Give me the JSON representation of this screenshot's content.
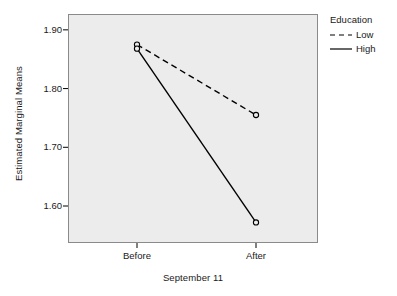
{
  "chart_data": {
    "type": "line",
    "title": "",
    "xlabel": "September 11",
    "ylabel": "Estimated Marginal Means",
    "categories": [
      "Before",
      "After"
    ],
    "xtick_labels": [
      "Before",
      "After"
    ],
    "ytick_labels": [
      "1.60",
      "1.70",
      "1.80",
      "1.90"
    ],
    "ytick_values": [
      1.6,
      1.7,
      1.8,
      1.9
    ],
    "ylim": [
      1.537,
      1.927
    ],
    "grid": false,
    "legend_position": "right",
    "legend_title": "Education",
    "marker": "open-circle",
    "series": [
      {
        "name": "Low",
        "linestyle": "dashed",
        "color": "#000000",
        "values": [
          1.875,
          1.755
        ]
      },
      {
        "name": "High",
        "linestyle": "solid",
        "color": "#000000",
        "values": [
          1.868,
          1.572
        ]
      }
    ]
  },
  "axes": {
    "ylabel": "Estimated Marginal Means",
    "xlabel": "September 11",
    "ytick_0": "1.60",
    "ytick_1": "1.70",
    "ytick_2": "1.80",
    "ytick_3": "1.90",
    "xtick_0": "Before",
    "xtick_1": "After"
  },
  "legend": {
    "title": "Education",
    "items": [
      {
        "label": "Low",
        "style": "dashed"
      },
      {
        "label": "High",
        "style": "solid"
      }
    ]
  }
}
